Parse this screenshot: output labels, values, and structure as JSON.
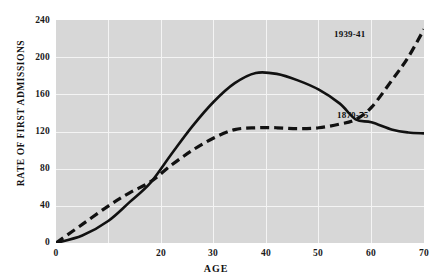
{
  "header": {
    "left_fragment": "",
    "right_fragment": ""
  },
  "axis": {
    "ylabel": "RATE OF FIRST ADMISSIONS",
    "xlabel": "AGE",
    "yticks": [
      "0",
      "40",
      "80",
      "120",
      "160",
      "200",
      "240"
    ],
    "xticks": [
      "0",
      "",
      "20",
      "30",
      "40",
      "50",
      "60",
      "70"
    ]
  },
  "series_labels": {
    "modern": "1939-41",
    "historic": "1870-75"
  },
  "colors": {
    "panel": "#d7d7d7",
    "gridline": "#f4f4f4",
    "curve": "#111111",
    "text": "#111111"
  },
  "chart_data": {
    "type": "line",
    "title": "",
    "xlabel": "AGE",
    "ylabel": "RATE OF FIRST ADMISSIONS",
    "xlim": [
      0,
      70
    ],
    "ylim": [
      0,
      240
    ],
    "xticks": [
      0,
      20,
      30,
      40,
      50,
      60,
      70
    ],
    "yticks": [
      0,
      40,
      80,
      120,
      160,
      200,
      240
    ],
    "grid": true,
    "legend": "inline-annotations",
    "annotations": [
      {
        "text": "1939-41",
        "x": 63,
        "y": 215
      },
      {
        "text": "1870-75",
        "x": 63,
        "y": 113
      }
    ],
    "series": [
      {
        "name": "1870-75",
        "style": "solid",
        "x": [
          0,
          5,
          10,
          14,
          18,
          22,
          26,
          30,
          34,
          38,
          42,
          46,
          50,
          54,
          57,
          60,
          64,
          67,
          70
        ],
        "values": [
          0,
          8,
          24,
          44,
          65,
          96,
          126,
          152,
          172,
          183,
          182,
          175,
          165,
          150,
          133,
          130,
          122,
          119,
          118
        ]
      },
      {
        "name": "1939-41",
        "style": "dashed",
        "x": [
          0,
          5,
          10,
          14,
          18,
          22,
          26,
          30,
          34,
          38,
          42,
          46,
          50,
          54,
          57,
          60,
          64,
          67,
          70
        ],
        "values": [
          0,
          20,
          40,
          54,
          66,
          84,
          100,
          113,
          122,
          124,
          124,
          123,
          124,
          128,
          133,
          146,
          176,
          200,
          230
        ]
      }
    ]
  }
}
